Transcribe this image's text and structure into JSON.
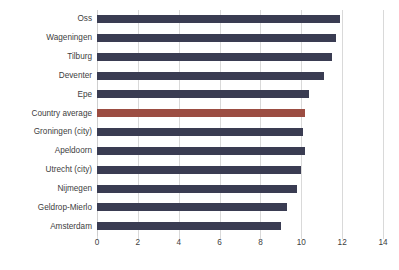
{
  "chart_data": {
    "type": "bar",
    "orientation": "horizontal",
    "title": "",
    "subtitle": "",
    "xlabel": "",
    "ylabel": "",
    "xlim": [
      0,
      14
    ],
    "xticks": [
      0,
      2,
      4,
      6,
      8,
      10,
      12,
      14
    ],
    "grid": true,
    "legend": false,
    "categories": [
      "Oss",
      "Wageningen",
      "Tilburg",
      "Deventer",
      "Epe",
      "Country average",
      "Groningen (city)",
      "Apeldoorn",
      "Utrecht (city)",
      "Nijmegen",
      "Geldrop-Mierlo",
      "Amsterdam"
    ],
    "values": [
      11.9,
      11.7,
      11.5,
      11.1,
      10.4,
      10.2,
      10.1,
      10.2,
      10.0,
      9.8,
      9.3,
      9.0
    ],
    "highlight_index": 5,
    "colors": {
      "bar": "#3a3c52",
      "highlight_bar": "#9c4d42",
      "gridline": "#d9d9d9",
      "text": "#404040",
      "background": "#ffffff"
    }
  }
}
